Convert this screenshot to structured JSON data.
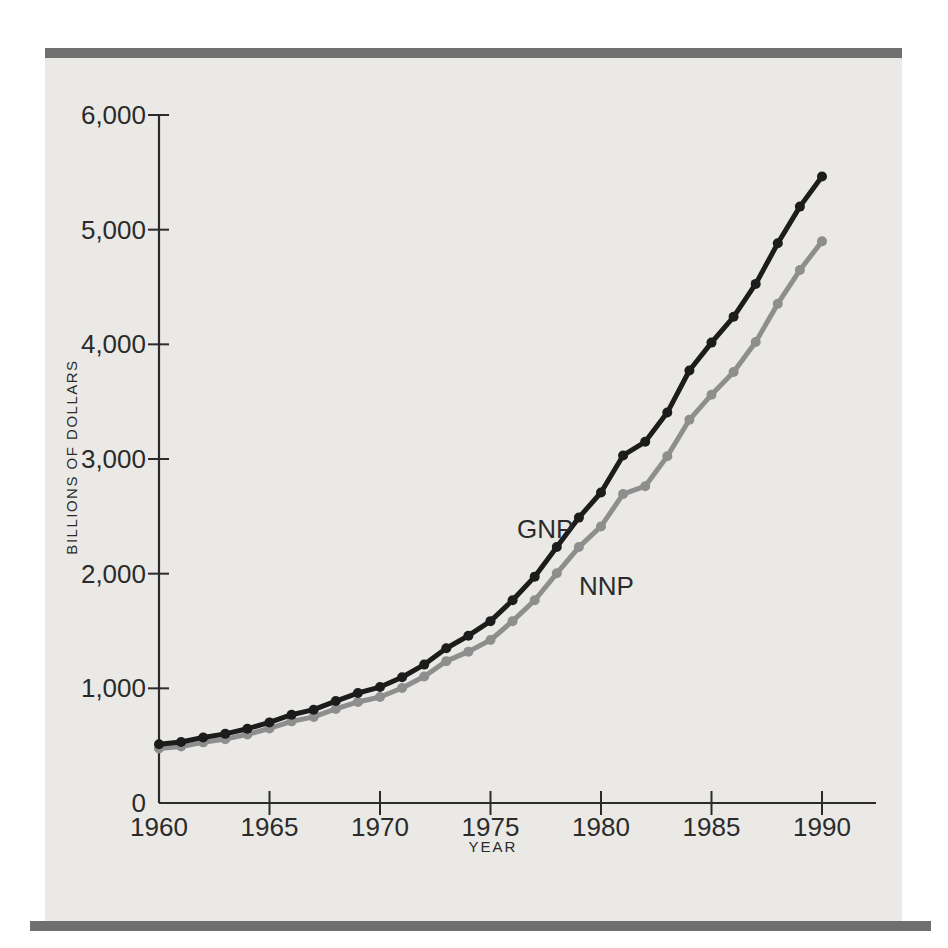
{
  "figure": {
    "panel_bg": "#eae9e5",
    "rule_color": "#6f6f6f",
    "ink_color": "#2b2b2b"
  },
  "chart_data": {
    "type": "line",
    "title": "",
    "xlabel": "YEAR",
    "ylabel": "BILLIONS OF DOLLARS",
    "xlim": [
      1960,
      1992.4
    ],
    "ylim": [
      0,
      6000
    ],
    "grid": false,
    "legend": "inline series labels at right-center of curves",
    "x": [
      1960,
      1961,
      1962,
      1963,
      1964,
      1965,
      1966,
      1967,
      1968,
      1969,
      1970,
      1971,
      1972,
      1973,
      1974,
      1975,
      1976,
      1977,
      1978,
      1979,
      1980,
      1981,
      1982,
      1983,
      1984,
      1985,
      1986,
      1987,
      1988,
      1989,
      1990
    ],
    "series": [
      {
        "name": "GNP",
        "color": "#1c1c1c",
        "values": [
          513,
          532,
          572,
          603,
          648,
          703,
          770,
          814,
          889,
          959,
          1011,
          1097,
          1207,
          1350,
          1459,
          1586,
          1768,
          1974,
          2233,
          2489,
          2708,
          3031,
          3150,
          3405,
          3772,
          4015,
          4240,
          4527,
          4881,
          5201,
          5463
        ]
      },
      {
        "name": "NNP",
        "color": "#8e8e8e",
        "values": [
          475,
          492,
          529,
          557,
          598,
          650,
          712,
          751,
          820,
          881,
          924,
          1003,
          1103,
          1237,
          1320,
          1421,
          1586,
          1768,
          2003,
          2232,
          2412,
          2694,
          2763,
          3024,
          3342,
          3561,
          3758,
          4020,
          4354,
          4648,
          4898
        ]
      }
    ],
    "xticks": [
      1960,
      1965,
      1970,
      1975,
      1980,
      1985,
      1990
    ],
    "yticks": [
      0,
      1000,
      2000,
      3000,
      4000,
      5000,
      6000
    ],
    "ytick_labels": [
      "0",
      "1,000",
      "2,000",
      "3,000",
      "4,000",
      "5,000",
      "6,000"
    ],
    "annotations": [
      {
        "text": "GNP",
        "x": 1976.2,
        "y": 2310
      },
      {
        "text": "NNP",
        "x": 1979.0,
        "y": 1815
      }
    ]
  }
}
